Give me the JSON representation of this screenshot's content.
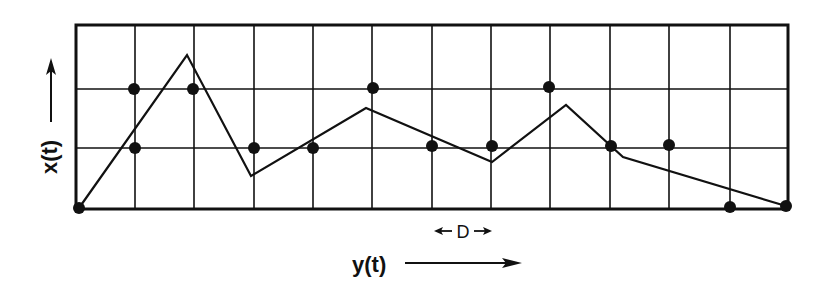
{
  "figure": {
    "ink_color": "#111111",
    "background": "#ffffff",
    "frame": {
      "x0": 76,
      "y0": 25,
      "x1": 788,
      "y1": 209
    },
    "grid": {
      "vertical_lines_x": [
        135,
        194,
        254,
        313,
        372,
        432,
        491,
        550,
        610,
        669,
        730
      ],
      "horizontal_lines_y": [
        89,
        148
      ]
    },
    "axis_labels": {
      "y_label": "x(t)",
      "x_label": "y(t)"
    },
    "spacing_marker": {
      "label": "D",
      "x_from": 434,
      "x_to": 492,
      "y": 231
    }
  },
  "chart_data": {
    "type": "line",
    "title": "",
    "xlabel": "y(t)",
    "ylabel": "x(t)",
    "grid": true,
    "grid_spacing_label": "D",
    "x_columns": 12,
    "y_rows": 3,
    "polyline_pixel_points": [
      [
        79,
        208
      ],
      [
        187,
        55
      ],
      [
        251,
        176
      ],
      [
        366,
        108
      ],
      [
        492,
        162
      ],
      [
        566,
        105
      ],
      [
        623,
        157
      ],
      [
        786,
        206
      ]
    ],
    "polyline_grid_points": [
      [
        0.05,
        0.02
      ],
      [
        1.87,
        2.6
      ],
      [
        2.95,
        0.58
      ],
      [
        4.9,
        1.72
      ],
      [
        7.02,
        0.8
      ],
      [
        8.27,
        1.76
      ],
      [
        9.23,
        0.88
      ],
      [
        11.98,
        0.05
      ]
    ],
    "sample_dots_grid": [
      [
        0,
        0
      ],
      [
        1,
        2
      ],
      [
        1,
        1
      ],
      [
        2,
        2
      ],
      [
        3,
        1
      ],
      [
        4,
        1
      ],
      [
        5,
        2
      ],
      [
        6,
        1
      ],
      [
        7,
        1
      ],
      [
        8,
        2
      ],
      [
        9,
        1
      ],
      [
        10,
        1
      ],
      [
        11,
        0
      ],
      [
        12,
        0
      ]
    ],
    "sample_dots_pixel": [
      [
        79,
        208
      ],
      [
        134,
        89
      ],
      [
        135,
        148
      ],
      [
        193,
        89
      ],
      [
        254,
        148
      ],
      [
        313,
        148
      ],
      [
        373,
        88
      ],
      [
        432,
        146
      ],
      [
        492,
        146
      ],
      [
        549,
        87
      ],
      [
        611,
        146
      ],
      [
        669,
        145
      ],
      [
        730,
        207
      ],
      [
        786,
        206
      ]
    ]
  }
}
